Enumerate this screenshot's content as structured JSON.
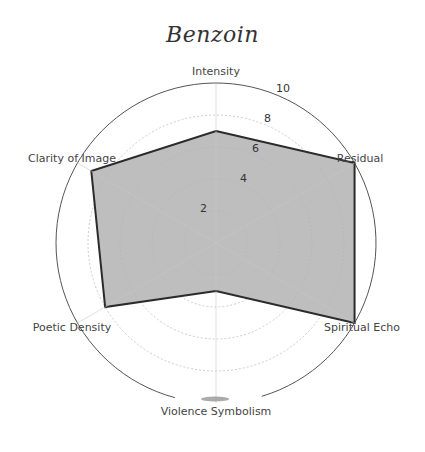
{
  "chart_data": {
    "type": "radar",
    "title": "Benzoin",
    "categories": [
      "Intensity",
      "Residual",
      "Spiritual Echo",
      "Violence Symbolism",
      "Poetic Density",
      "Clarity of Image"
    ],
    "series": [
      {
        "name": "Benzoin",
        "values": [
          7,
          10,
          10,
          3,
          8,
          9
        ]
      }
    ],
    "radial_ticks": [
      2,
      4,
      6,
      8,
      10
    ],
    "rlim": [
      0,
      10
    ],
    "grid": true,
    "legend": "none",
    "colors": {
      "fill": "#b3b3b3",
      "edge": "#2b2b2b",
      "grid": "#cccccc",
      "outer": "#555555"
    }
  },
  "labels": {
    "title": "Benzoin",
    "axes": [
      "Intensity",
      "Residual",
      "Spiritual Echo",
      "Violence Symbolism",
      "Poetic Density",
      "Clarity of Image"
    ],
    "ticks": [
      "2",
      "4",
      "6",
      "8",
      "10"
    ]
  }
}
